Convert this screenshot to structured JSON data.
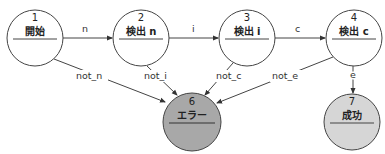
{
  "diagram": {
    "type": "state-machine",
    "nodes": [
      {
        "id": "1",
        "num": "1",
        "label": "開始",
        "cx": 35,
        "cy": 38,
        "r": 28,
        "fill": "#ffffff"
      },
      {
        "id": "2",
        "num": "2",
        "label": "検出 n",
        "cx": 141,
        "cy": 38,
        "r": 28,
        "fill": "#ffffff"
      },
      {
        "id": "3",
        "num": "3",
        "label": "検出 i",
        "cx": 247,
        "cy": 38,
        "r": 28,
        "fill": "#ffffff"
      },
      {
        "id": "4",
        "num": "4",
        "label": "検出 c",
        "cx": 354,
        "cy": 38,
        "r": 28,
        "fill": "#ffffff"
      },
      {
        "id": "6",
        "num": "6",
        "label": "エラー",
        "cx": 192,
        "cy": 122,
        "r": 29,
        "fill": "#a8a8a8"
      },
      {
        "id": "7",
        "num": "7",
        "label": "成功",
        "cx": 352,
        "cy": 122,
        "r": 28,
        "fill": "#d6d6d6"
      }
    ],
    "edges": [
      {
        "from": "1",
        "to": "2",
        "label": "n"
      },
      {
        "from": "2",
        "to": "3",
        "label": "i"
      },
      {
        "from": "3",
        "to": "4",
        "label": "c"
      },
      {
        "from": "4",
        "to": "7",
        "label": "e"
      },
      {
        "from": "1",
        "to": "6",
        "label": "not_n"
      },
      {
        "from": "2",
        "to": "6",
        "label": "not_i"
      },
      {
        "from": "3",
        "to": "6",
        "label": "not_c"
      },
      {
        "from": "4",
        "to": "6",
        "label": "not_e"
      }
    ]
  }
}
